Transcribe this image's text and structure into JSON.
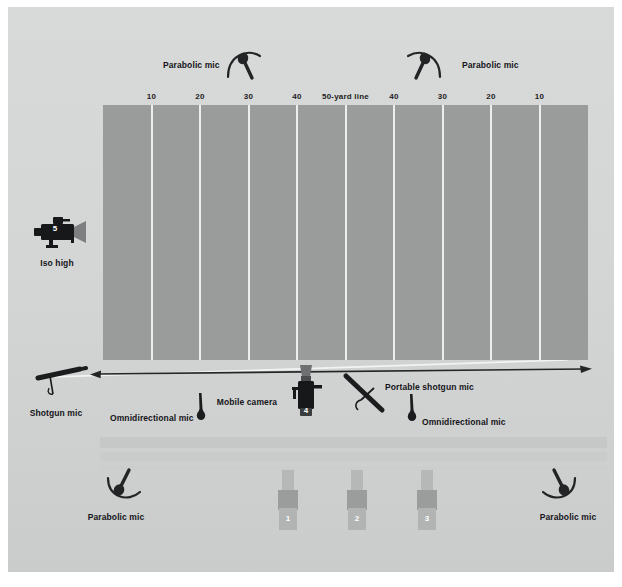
{
  "diagram": {
    "field": {
      "yard_labels": [
        "10",
        "20",
        "30",
        "40",
        "50-yard line",
        "40",
        "30",
        "20",
        "10"
      ],
      "field_color": "#9a9b9b",
      "line_color": "#eceded",
      "background_color": "#d5d6d6"
    },
    "annotations": [
      {
        "id": "parabolic-mic-top-left",
        "label": "Parabolic mic",
        "icon": "parabolic-mic-icon"
      },
      {
        "id": "parabolic-mic-top-right",
        "label": "Parabolic mic",
        "icon": "parabolic-mic-icon"
      },
      {
        "id": "iso-high-camera",
        "label": "Iso high",
        "icon": "video-camera-icon",
        "number": "5"
      },
      {
        "id": "shotgun-mic",
        "label": "Shotgun mic",
        "icon": "shotgun-mic-icon"
      },
      {
        "id": "omnidirectional-mic-left",
        "label": "Omnidirectional mic",
        "icon": "omnidirectional-mic-icon"
      },
      {
        "id": "mobile-camera",
        "label": "Mobile camera",
        "icon": "mobile-camera-icon",
        "number": "4"
      },
      {
        "id": "portable-shotgun-mic",
        "label": "Portable shotgun mic",
        "icon": "portable-shotgun-mic-icon"
      },
      {
        "id": "omnidirectional-mic-right",
        "label": "Omnidirectional mic",
        "icon": "omnidirectional-mic-icon"
      },
      {
        "id": "parabolic-mic-bottom-left",
        "label": "Parabolic mic",
        "icon": "parabolic-mic-icon"
      },
      {
        "id": "parabolic-mic-bottom-right",
        "label": "Parabolic mic",
        "icon": "parabolic-mic-icon"
      }
    ],
    "sideline_cameras": [
      {
        "id": "camera-1",
        "number": "1"
      },
      {
        "id": "camera-2",
        "number": "2"
      },
      {
        "id": "camera-3",
        "number": "3"
      }
    ]
  }
}
